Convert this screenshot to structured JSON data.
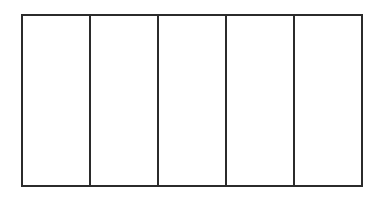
{
  "diagram": {
    "type": "rectangle-divided-into-equal-parts",
    "rows": 1,
    "columns": 5,
    "cells": [
      {
        "label": ""
      },
      {
        "label": ""
      },
      {
        "label": ""
      },
      {
        "label": ""
      },
      {
        "label": ""
      }
    ],
    "stroke_color": "#2b2b2b",
    "fill_color": "#ffffff"
  }
}
